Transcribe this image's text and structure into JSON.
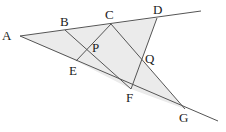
{
  "diagram": {
    "type": "geometry",
    "shade_color": "#ebebeb",
    "line_color": "#555555",
    "points": {
      "A": {
        "label": "A",
        "x": 20,
        "y": 36
      },
      "B": {
        "label": "B",
        "x": 65,
        "y": 30
      },
      "C": {
        "label": "C",
        "x": 111,
        "y": 24
      },
      "D": {
        "label": "D",
        "x": 157,
        "y": 18
      },
      "E": {
        "label": "E",
        "x": 76,
        "y": 61
      },
      "F": {
        "label": "F",
        "x": 131,
        "y": 89
      },
      "G": {
        "label": "G",
        "x": 185,
        "y": 109
      },
      "P": {
        "label": "P",
        "x": 88,
        "y": 48
      },
      "Q": {
        "label": "Q",
        "x": 142,
        "y": 60
      }
    },
    "segments": [
      [
        "A",
        "upper-end"
      ],
      [
        "A",
        "lower-end"
      ],
      [
        "B",
        "F"
      ],
      [
        "E",
        "C"
      ],
      [
        "C",
        "G"
      ],
      [
        "D",
        "F"
      ]
    ],
    "labels": {
      "A": "A",
      "B": "B",
      "C": "C",
      "D": "D",
      "E": "E",
      "F": "F",
      "G": "G",
      "P": "P",
      "Q": "Q"
    }
  }
}
